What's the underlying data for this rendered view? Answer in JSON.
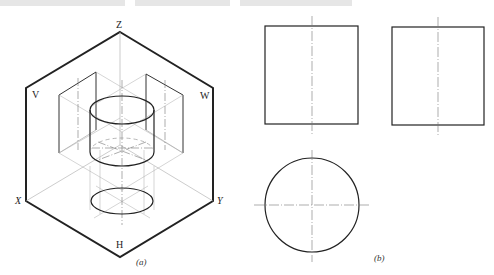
{
  "figure": {
    "panel_a": {
      "caption": "(a)",
      "planes": {
        "v": "V",
        "w": "W",
        "h": "H"
      },
      "axes": {
        "x": "X",
        "y": "Y",
        "z": "Z"
      }
    },
    "panel_b": {
      "caption": "(b)",
      "views": [
        "front-view-rectangle",
        "side-view-rectangle",
        "top-view-circle"
      ]
    }
  },
  "colors": {
    "line": "#222222",
    "thin": "#999999",
    "center": "#777777"
  }
}
